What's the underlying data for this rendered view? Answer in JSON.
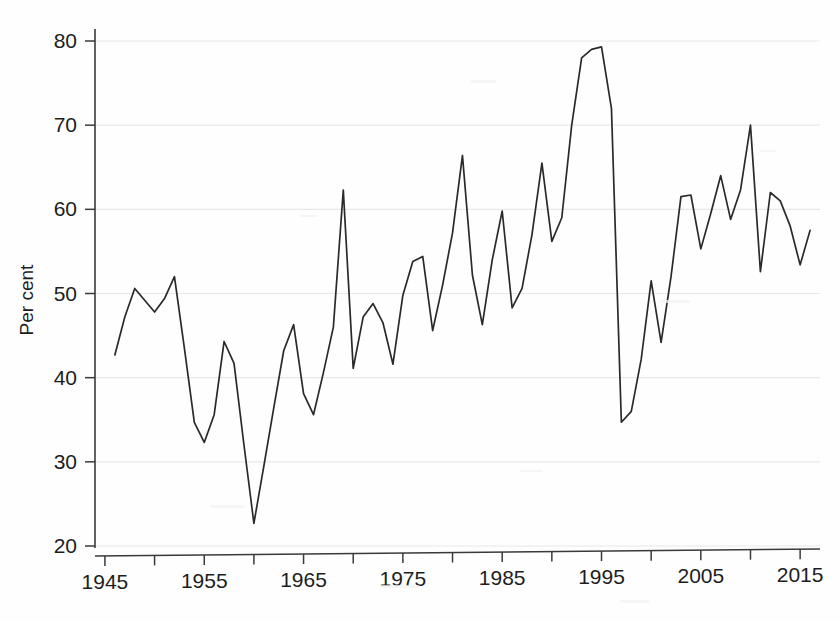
{
  "chart_data": {
    "type": "line",
    "title": "",
    "subtitle": "",
    "xlabel": "",
    "ylabel": "Per cent",
    "xlim": [
      1944,
      2017
    ],
    "ylim": [
      18,
      82
    ],
    "yticks": [
      20,
      30,
      40,
      50,
      60,
      70,
      80
    ],
    "ytick_labels": [
      "20",
      "30",
      "40",
      "50",
      "60",
      "70",
      "80"
    ],
    "xticks": [
      1945,
      1950,
      1955,
      1960,
      1965,
      1970,
      1975,
      1980,
      1985,
      1990,
      1995,
      2000,
      2005,
      2010,
      2015
    ],
    "xtick_labels_major": [
      "1945",
      "1955",
      "1965",
      "1975",
      "1985",
      "1995",
      "2005",
      "2015"
    ],
    "xticks_major": [
      1945,
      1955,
      1965,
      1975,
      1985,
      1995,
      2005,
      2015
    ],
    "grid": true,
    "grid_axis": "y",
    "legend": false,
    "legend_position": "none",
    "line_color": "#2a2a2a",
    "grid_color": "#e8e8ec",
    "axis_color": "#3a3a3a",
    "background_color": "#fefefe",
    "series": [
      {
        "name": "Per cent",
        "x": [
          1946,
          1947,
          1948,
          1949,
          1950,
          1951,
          1952,
          1953,
          1954,
          1955,
          1956,
          1957,
          1958,
          1959,
          1960,
          1961,
          1962,
          1963,
          1964,
          1965,
          1966,
          1967,
          1968,
          1969,
          1970,
          1971,
          1972,
          1973,
          1974,
          1975,
          1976,
          1977,
          1978,
          1979,
          1980,
          1981,
          1982,
          1983,
          1984,
          1985,
          1986,
          1987,
          1988,
          1989,
          1990,
          1991,
          1992,
          1993,
          1994,
          1995,
          1996,
          1997,
          1998,
          1999,
          2000,
          2001,
          2002,
          2003,
          2004,
          2005,
          2006,
          2007,
          2008,
          2009,
          2010,
          2011,
          2012,
          2013,
          2014,
          2015,
          2016
        ],
        "values": [
          42.7,
          47.2,
          50.6,
          49.2,
          47.8,
          49.4,
          52.0,
          43.5,
          34.7,
          32.3,
          35.6,
          44.3,
          41.7,
          32.0,
          22.7,
          29.5,
          36.4,
          43.2,
          46.3,
          38.1,
          35.6,
          40.6,
          46.0,
          62.3,
          41.1,
          47.2,
          48.8,
          46.5,
          41.6,
          49.8,
          53.8,
          54.4,
          45.6,
          51.0,
          57.2,
          66.4,
          52.2,
          46.3,
          54.0,
          59.8,
          48.3,
          50.6,
          57.0,
          65.5,
          56.2,
          59.0,
          70.0,
          78.0,
          79.0,
          79.3,
          72.0,
          34.7,
          36.0,
          42.2,
          51.5,
          44.2,
          52.0,
          61.5,
          61.7,
          55.3,
          59.5,
          64.0,
          58.8,
          62.3,
          70.0,
          52.6,
          62.0,
          61.0,
          58.0,
          53.4,
          57.5
        ]
      }
    ]
  },
  "figure": {
    "y_axis_title": "Per cent"
  }
}
